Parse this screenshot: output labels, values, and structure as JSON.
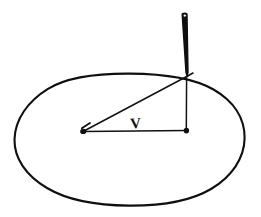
{
  "figure": {
    "background_color": "#ffffff",
    "ink_color": "#100f0e",
    "canvas": {
      "width": 261,
      "height": 217
    },
    "labels": [
      {
        "name": "angle-label-v",
        "text": "V",
        "x": 136,
        "y": 128,
        "font_size": 15,
        "rotation": -4
      }
    ],
    "elements": {
      "ellipse": {
        "name": "perspective-circle",
        "center_x": 129,
        "center_y": 140,
        "radius_x": 115,
        "radius_y": 66,
        "stroke_width": 2.1,
        "path": "M 14.5,139.5 C 14.9,119.5 28.0,101.0 48.0,88.8 C 68.5,76.2 98.0,73.4 129.5,73.6 C 162.0,73.8 192.0,77.0 213.5,89.5 C 234.0,101.3 244.8,118.5 244.6,138.0 C 244.4,158.0 232.0,176.5 211.0,189.0 C 189.5,201.8 160.0,205.8 129.0,205.6 C 97.5,205.4 68.0,200.5 47.0,188.0 C 26.5,175.8 14.1,158.5 14.5,139.5 Z"
      },
      "rod": {
        "name": "upright-rod",
        "top_x": 184.6,
        "top_y": 12.5,
        "bottom_x": 187.0,
        "bottom_y": 78.5,
        "top_width": 6.2,
        "bottom_width": 3.4,
        "eyelet": {
          "cx": 184.8,
          "cy": 15.6,
          "r": 1.5
        }
      },
      "baseline": {
        "name": "horizontal-baseline",
        "x1": 84.0,
        "y1": 131.4,
        "x2": 186.5,
        "y2": 130.4,
        "stroke_width": 1.5
      },
      "hypotenuse": {
        "name": "diagonal-sight-line",
        "x1": 84.0,
        "y1": 131.0,
        "x2": 187.6,
        "y2": 76.0,
        "stroke_width": 1.5,
        "overshoot_x": 193.0,
        "overshoot_y": 73.0
      },
      "vertical_drop": {
        "name": "vertical-drop-line",
        "x1": 186.6,
        "y1": 78.0,
        "x2": 186.3,
        "y2": 131.0,
        "stroke_width": 1.5
      },
      "left_pivot": {
        "name": "left-pivot-marker",
        "cx": 83.2,
        "cy": 131.4,
        "rx": 3.0,
        "ry": 2.7
      },
      "right_pivot": {
        "name": "right-pivot-marker",
        "cx": 186.4,
        "cy": 130.6,
        "rx": 2.7,
        "ry": 2.9
      },
      "left_tick": {
        "name": "left-pivot-tick",
        "x1": 81.8,
        "y1": 128.3,
        "x2": 90.0,
        "y2": 123.0
      }
    }
  }
}
